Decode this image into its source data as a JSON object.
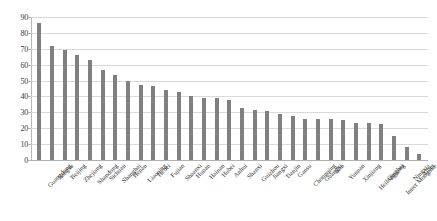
{
  "chart_data": {
    "type": "bar",
    "title": "",
    "subtitle": "",
    "xlabel": "",
    "ylabel": "",
    "ylim": [
      0,
      90
    ],
    "ytick_step": 10,
    "yticks": [
      0,
      10,
      20,
      30,
      40,
      50,
      60,
      70,
      80,
      90
    ],
    "grid": true,
    "legend": false,
    "bar_color": "#808080",
    "gridline_color": "#d9d9d9",
    "categories": [
      "Guangdong",
      "Jiangsu",
      "Beijing",
      "Zhejiang",
      "Shandong",
      "Sichuan",
      "Shanghai",
      "Henan",
      "Liaoning",
      "Hebei",
      "Fujian",
      "Shaanxi",
      "Hunan",
      "Hainan",
      "Hubei",
      "Anhui",
      "Shanxi",
      "Guizhou",
      "Jiangxi",
      "Tianjin",
      "Gansu",
      "Chongqing",
      "Guangxi",
      "Jilin",
      "Yunnan",
      "Xinjiang",
      "Heilongjiang",
      "Qinghai",
      "Inner Mongolia",
      "Ningxia",
      "Tibet"
    ],
    "values": [
      86,
      71.5,
      69,
      66,
      63,
      56.5,
      53.5,
      50,
      47.5,
      46.5,
      44,
      42.5,
      40.5,
      39,
      39,
      38,
      33,
      31.5,
      31,
      29,
      28,
      26,
      26,
      26,
      25,
      23.5,
      23,
      22.5,
      15,
      8.5,
      3.5
    ]
  }
}
